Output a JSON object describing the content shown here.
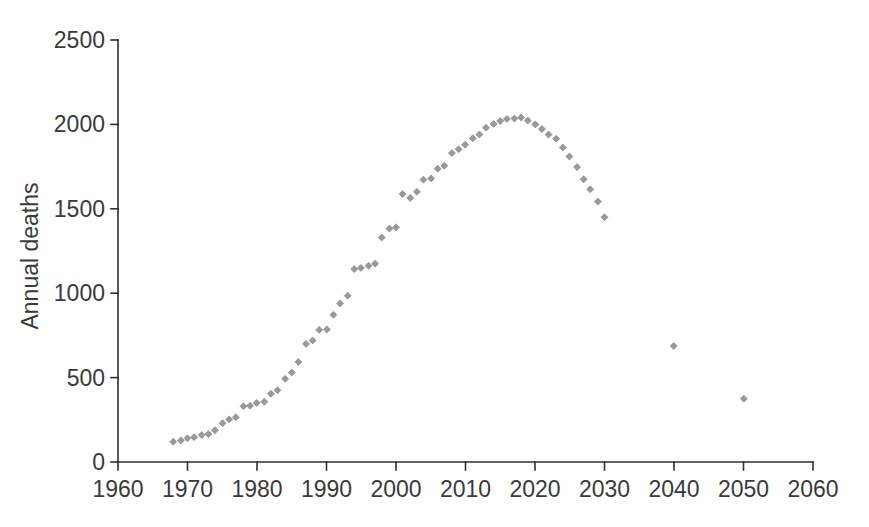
{
  "chart_data": {
    "type": "scatter",
    "title": "",
    "xlabel": "",
    "ylabel": "Annual deaths",
    "xlim": [
      1960,
      2060
    ],
    "ylim": [
      0,
      2500
    ],
    "x_ticks": [
      1960,
      1970,
      1980,
      1990,
      2000,
      2010,
      2020,
      2030,
      2040,
      2050,
      2060
    ],
    "y_ticks": [
      0,
      500,
      1000,
      1500,
      2000,
      2500
    ],
    "grid": false,
    "legend": false,
    "background": "#ffffff",
    "axis_color": "#2f2f2f",
    "tick_label_color": "#3a3a3a",
    "marker": {
      "shape": "diamond",
      "color": "#9a9a9a",
      "edge_color": "#7e7e7e",
      "size_px": 7
    },
    "series": [
      {
        "name": "annual deaths (observed and projected)",
        "points": [
          [
            1968,
            115
          ],
          [
            1969,
            125
          ],
          [
            1970,
            140
          ],
          [
            1971,
            150
          ],
          [
            1972,
            165
          ],
          [
            1973,
            160
          ],
          [
            1974,
            185
          ],
          [
            1975,
            230
          ],
          [
            1976,
            255
          ],
          [
            1977,
            270
          ],
          [
            1978,
            325
          ],
          [
            1979,
            330
          ],
          [
            1980,
            350
          ],
          [
            1981,
            360
          ],
          [
            1982,
            410
          ],
          [
            1983,
            420
          ],
          [
            1984,
            490
          ],
          [
            1985,
            530
          ],
          [
            1986,
            595
          ],
          [
            1987,
            705
          ],
          [
            1988,
            715
          ],
          [
            1989,
            780
          ],
          [
            1990,
            785
          ],
          [
            1991,
            875
          ],
          [
            1992,
            945
          ],
          [
            1993,
            980
          ],
          [
            1994,
            1140
          ],
          [
            1995,
            1150
          ],
          [
            1996,
            1165
          ],
          [
            1997,
            1180
          ],
          [
            1998,
            1325
          ],
          [
            1999,
            1380
          ],
          [
            2000,
            1390
          ],
          [
            2001,
            1590
          ],
          [
            2002,
            1570
          ],
          [
            2003,
            1595
          ],
          [
            2004,
            1670
          ],
          [
            2005,
            1680
          ],
          [
            2006,
            1740
          ],
          [
            2007,
            1760
          ],
          [
            2008,
            1825
          ],
          [
            2009,
            1850
          ],
          [
            2010,
            1880
          ],
          [
            2011,
            1920
          ],
          [
            2012,
            1945
          ],
          [
            2013,
            1975
          ],
          [
            2014,
            2000
          ],
          [
            2015,
            2020
          ],
          [
            2016,
            2035
          ],
          [
            2017,
            2040
          ],
          [
            2018,
            2035
          ],
          [
            2019,
            2020
          ],
          [
            2020,
            2000
          ],
          [
            2021,
            1975
          ],
          [
            2022,
            1945
          ],
          [
            2023,
            1910
          ],
          [
            2024,
            1860
          ],
          [
            2025,
            1810
          ],
          [
            2026,
            1750
          ],
          [
            2027,
            1680
          ],
          [
            2028,
            1610
          ],
          [
            2029,
            1540
          ],
          [
            2030,
            1450
          ],
          [
            2040,
            690
          ],
          [
            2050,
            380
          ]
        ]
      }
    ]
  }
}
